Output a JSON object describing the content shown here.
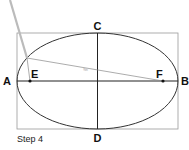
{
  "diagram": {
    "caption": "Step 4",
    "labels": {
      "A": "A",
      "B": "B",
      "C": "C",
      "D": "D",
      "E": "E",
      "F": "F"
    },
    "line_label": "Spc",
    "colors": {
      "ellipse": "#333333",
      "box": "#999999",
      "axis": "#222222",
      "string_line": "#888888",
      "pencil": "#bbbbbb"
    }
  }
}
